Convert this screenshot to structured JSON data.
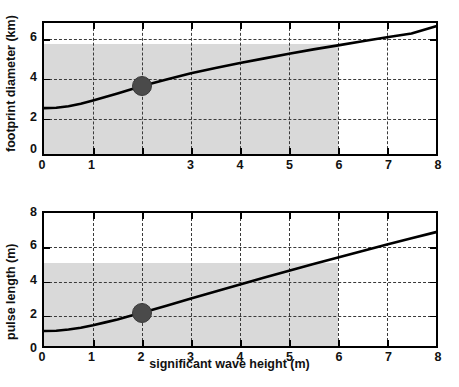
{
  "figure": {
    "background": "#ffffff",
    "curve_color": "#000000",
    "grid_color": "#3a3a3a",
    "shade_color": "#d9d9d9",
    "marker_color": "#4a4a4a"
  },
  "panels": [
    {
      "id": "footprint-diameter",
      "ylabel": "footprint diameter (km)",
      "xlabel": "",
      "xticks": [
        "0",
        "1",
        "",
        "3",
        "4",
        "5",
        "6",
        "7",
        "8"
      ],
      "yticks": [
        "0",
        "2",
        "4",
        "6"
      ],
      "marker": {
        "x": 2,
        "y": 3.55
      }
    },
    {
      "id": "pulse-length",
      "ylabel": "pulse length (m)",
      "xlabel": "significant wave height (m)",
      "xticks": [
        "0",
        "1",
        "2",
        "3",
        "4",
        "5",
        "6",
        "7",
        "8"
      ],
      "yticks": [
        "0",
        "2",
        "4",
        "6",
        "8"
      ],
      "marker": {
        "x": 2,
        "y": 2.0
      }
    }
  ],
  "chart_data": [
    {
      "type": "line",
      "title": "",
      "xlabel": "",
      "ylabel": "footprint diameter (km)",
      "xlim": [
        0,
        8
      ],
      "ylim": [
        0,
        6.85
      ],
      "xticks": [
        0,
        1,
        2,
        3,
        4,
        5,
        6,
        7,
        8
      ],
      "yticks": [
        0,
        2,
        4,
        6
      ],
      "grid": true,
      "legend": "none",
      "series": [
        {
          "name": "footprint diameter",
          "x": [
            0,
            0.25,
            0.5,
            0.75,
            1,
            1.25,
            1.5,
            1.75,
            2,
            2.5,
            3,
            3.5,
            4,
            4.5,
            5,
            5.5,
            6,
            6.5,
            7,
            7.5,
            8
          ],
          "y": [
            2.4,
            2.42,
            2.5,
            2.63,
            2.8,
            2.98,
            3.17,
            3.36,
            3.55,
            3.9,
            4.22,
            4.5,
            4.76,
            5.0,
            5.24,
            5.47,
            5.68,
            5.9,
            6.1,
            6.3,
            6.68
          ]
        }
      ],
      "shaded_region": {
        "x_range": [
          0,
          6
        ],
        "y_range": [
          0,
          5.75
        ],
        "color": "#d9d9d9"
      },
      "annotations": [
        {
          "type": "marker",
          "x": 2,
          "y": 3.55,
          "color": "#4a4a4a"
        }
      ]
    },
    {
      "type": "line",
      "title": "",
      "xlabel": "significant wave height (m)",
      "ylabel": "pulse length (m)",
      "xlim": [
        0,
        8
      ],
      "ylim": [
        0,
        8
      ],
      "xticks": [
        0,
        1,
        2,
        3,
        4,
        5,
        6,
        7,
        8
      ],
      "yticks": [
        0,
        2,
        4,
        6,
        8
      ],
      "grid": true,
      "legend": "none",
      "series": [
        {
          "name": "pulse length",
          "x": [
            0,
            0.25,
            0.5,
            0.75,
            1,
            1.25,
            1.5,
            1.75,
            2,
            2.5,
            3,
            3.5,
            4,
            4.5,
            5,
            5.5,
            6,
            6.5,
            7,
            7.5,
            8
          ],
          "y": [
            0.9,
            0.92,
            0.99,
            1.1,
            1.25,
            1.42,
            1.6,
            1.8,
            2.0,
            2.42,
            2.85,
            3.28,
            3.7,
            4.12,
            4.53,
            4.93,
            5.32,
            5.72,
            6.1,
            6.48,
            6.85
          ]
        }
      ],
      "shaded_region": {
        "x_range": [
          0,
          6
        ],
        "y_range": [
          0,
          5.0
        ],
        "color": "#d9d9d9"
      },
      "annotations": [
        {
          "type": "marker",
          "x": 2,
          "y": 2.0,
          "color": "#4a4a4a"
        }
      ]
    }
  ]
}
